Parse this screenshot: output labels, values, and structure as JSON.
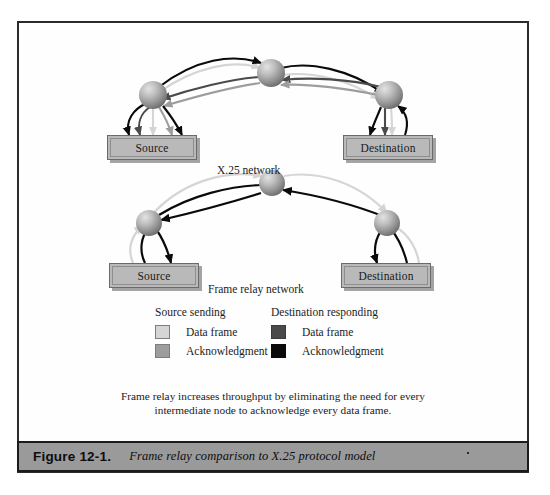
{
  "figure": {
    "caption_number": "Figure 12-1.",
    "caption_text": "Frame relay comparison to X.25 protocol model"
  },
  "diagrams": [
    {
      "id": "x25",
      "label": "X.25 network",
      "source_label": "Source",
      "destination_label": "Destination"
    },
    {
      "id": "frame-relay",
      "label": "Frame relay network",
      "source_label": "Source",
      "destination_label": "Destination"
    }
  ],
  "legend": {
    "source": {
      "title": "Source sending",
      "items": [
        {
          "label": "Data frame",
          "color": "#d5d5d5"
        },
        {
          "label": "Acknowledgment",
          "color": "#9d9d9d"
        }
      ]
    },
    "destination": {
      "title": "Destination responding",
      "items": [
        {
          "label": "Data frame",
          "color": "#4a4a4a"
        },
        {
          "label": "Acknowledgment",
          "color": "#0a0a0a"
        }
      ]
    }
  },
  "note": {
    "line1": "Frame relay increases throughput by eliminating the need for every",
    "line2": "intermediate node to acknowledge every data frame."
  },
  "colors": {
    "source_data": "#d5d5d5",
    "source_ack": "#9d9d9d",
    "dest_data": "#4a4a4a",
    "dest_ack": "#0a0a0a",
    "node_fill": "#a6a6a6",
    "box_fill": "#b9b9b9",
    "frame_border": "#2b2b2b",
    "caption_bar": "#9a9a9a"
  }
}
